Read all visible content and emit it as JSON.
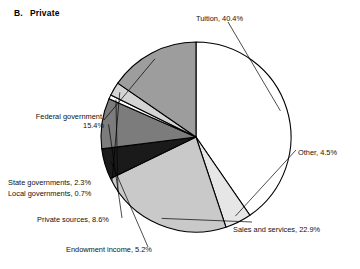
{
  "panel": {
    "letter": "B.",
    "title": "Private"
  },
  "chart_data": {
    "type": "pie",
    "xlabel": "",
    "ylabel": "",
    "legend_position": "none",
    "grid": false,
    "units": "percent",
    "categories": [
      "Tuition",
      "Other",
      "Sales and services",
      "Endowment income",
      "Private sources",
      "Local governments",
      "State governments",
      "Federal government"
    ],
    "values": [
      40.4,
      4.5,
      22.9,
      5.2,
      8.6,
      0.7,
      2.3,
      15.4
    ],
    "slices": [
      {
        "label": "Tuition",
        "value": 40.4,
        "text": "Tuition, 40.4%",
        "color": "#ffffff"
      },
      {
        "label": "Other",
        "value": 4.5,
        "text": "Other, 4.5%",
        "color": "#e6e6e6"
      },
      {
        "label": "Sales and services",
        "value": 22.9,
        "text": "Sales and services, 22.9%",
        "color": "#c9c9c9"
      },
      {
        "label": "Endowment income",
        "value": 5.2,
        "text": "Endowment income, 5.2%",
        "color": "#1a1a1a"
      },
      {
        "label": "Private sources",
        "value": 8.6,
        "text": "Private sources, 8.6%",
        "color": "#7c7c7c"
      },
      {
        "label": "Local governments",
        "value": 0.7,
        "text": "Local governments, 0.7%",
        "color": "#ffffff"
      },
      {
        "label": "State governments",
        "value": 2.3,
        "text": "State governments, 2.3%",
        "color": "#d4d4d4"
      },
      {
        "label": "Federal government",
        "value": 15.4,
        "text": "Federal government, 15.4%",
        "color": "#9d9d9d"
      }
    ],
    "start_angle_deg": 0,
    "direction": "clockwise",
    "stroke_color": "#000000"
  }
}
